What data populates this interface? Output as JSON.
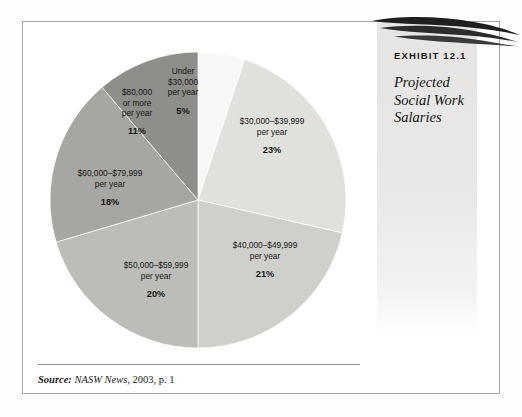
{
  "exhibit": {
    "number_label": "EXHIBIT 12.1",
    "title_lines": [
      "Projected",
      "Social Work",
      "Salaries"
    ],
    "title_full": "Projected Social Work Salaries",
    "swoosh_icon": "swoosh-graphic"
  },
  "source": {
    "lead": "Source:",
    "publication": "NASW News",
    "rest": ", 2003, p. 1",
    "full": "Source: NASW News, 2003, p. 1"
  },
  "chart_data": {
    "type": "pie",
    "title": "Projected Social Work Salaries",
    "xlabel": "",
    "ylabel": "",
    "grid": false,
    "legend": "none",
    "start_angle_deg": 0,
    "direction": "clockwise",
    "units": "percent",
    "total": 98,
    "categories": [
      "Under $30,000 per year",
      "$30,000–$39,999 per year",
      "$40,000–$49,999 per year",
      "$50,000–$59,999 per year",
      "$60,000–$79,999 per year",
      "$80,000 or more per year"
    ],
    "values": [
      5,
      23,
      21,
      20,
      18,
      11
    ],
    "value_labels": [
      "5%",
      "23%",
      "21%",
      "20%",
      "18%",
      "11%"
    ],
    "colors": [
      "#f7f7f5",
      "#e0e0dd",
      "#cfcfcb",
      "#bcbcb8",
      "#a6a6a2",
      "#8e8e8a"
    ],
    "slices": [
      {
        "label_lines": [
          "Under",
          "$30,000",
          "per year"
        ],
        "name": "Under $30,000 per year",
        "value": 5,
        "value_label": "5%",
        "color": "#f7f7f5"
      },
      {
        "label_lines": [
          "$30,000–$39,999",
          "per year"
        ],
        "name": "$30,000–$39,999 per year",
        "value": 23,
        "value_label": "23%",
        "color": "#e0e0dd"
      },
      {
        "label_lines": [
          "$40,000–$49,999",
          "per year"
        ],
        "name": "$40,000–$49,999 per year",
        "value": 21,
        "value_label": "21%",
        "color": "#cfcfcb"
      },
      {
        "label_lines": [
          "$50,000–$59,999",
          "per year"
        ],
        "name": "$50,000–$59,999 per year",
        "value": 20,
        "value_label": "20%",
        "color": "#bcbcb8"
      },
      {
        "label_lines": [
          "$60,000–$79,999",
          "per year"
        ],
        "name": "$60,000–$79,999 per year",
        "value": 18,
        "value_label": "18%",
        "color": "#a6a6a2"
      },
      {
        "label_lines": [
          "$80,000",
          "or more",
          "per year"
        ],
        "name": "$80,000 or more per year",
        "value": 11,
        "value_label": "11%",
        "color": "#8e8e8a"
      }
    ]
  }
}
